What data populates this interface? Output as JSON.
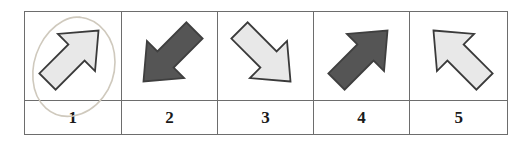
{
  "figure": {
    "type": "arrow-direction-stimulus-grid",
    "columns": 5,
    "rows": 2,
    "border_color": "#6d6d6d",
    "background_color": "#ffffff"
  },
  "colors": {
    "light_arrow_fill": "#e8e8e8",
    "light_arrow_stroke": "#3a3a3a",
    "dark_arrow_fill": "#555555",
    "dark_arrow_stroke": "#3f3f3f",
    "annotation_stroke": "#cfc9bd",
    "label_text": "#1a1a1a",
    "grid_line": "#6d6d6d"
  },
  "cells": [
    {
      "label": "1",
      "icon": "arrow-northeast-icon",
      "direction": "northeast",
      "shade": "light",
      "rotation_deg": 45,
      "annotated": true,
      "annotation": "hand-drawn-oval"
    },
    {
      "label": "2",
      "icon": "arrow-southwest-icon",
      "direction": "southwest",
      "shade": "dark",
      "rotation_deg": 225,
      "annotated": false,
      "annotation": ""
    },
    {
      "label": "3",
      "icon": "arrow-southeast-icon",
      "direction": "southeast",
      "shade": "light",
      "rotation_deg": 135,
      "annotated": false,
      "annotation": ""
    },
    {
      "label": "4",
      "icon": "arrow-northeast-icon",
      "direction": "northeast",
      "shade": "dark",
      "rotation_deg": 45,
      "annotated": false,
      "annotation": ""
    },
    {
      "label": "5",
      "icon": "arrow-northwest-icon",
      "direction": "northwest",
      "shade": "light",
      "rotation_deg": 315,
      "annotated": false,
      "annotation": ""
    }
  ]
}
